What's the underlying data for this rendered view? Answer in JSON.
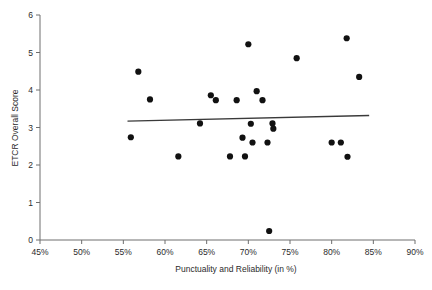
{
  "chart_data": {
    "type": "scatter",
    "title": "",
    "xlabel": "Punctuality and Reliability (in %)",
    "ylabel": "ETCR Overall Score",
    "xlim": [
      45,
      90
    ],
    "ylim": [
      0,
      6
    ],
    "xticks": [
      45,
      50,
      55,
      60,
      65,
      70,
      75,
      80,
      85,
      90
    ],
    "xtick_labels": [
      "45%",
      "50%",
      "55%",
      "60%",
      "65%",
      "70%",
      "75%",
      "80%",
      "85%",
      "90%"
    ],
    "yticks": [
      0,
      1,
      2,
      3,
      4,
      5,
      6
    ],
    "ytick_labels": [
      "0",
      "1",
      "2",
      "3",
      "4",
      "5",
      "6"
    ],
    "grid": false,
    "legend": false,
    "marker_color": "#111111",
    "trendline_color": "#3a3a3a",
    "axis_color": "#6e6e6e",
    "points": [
      {
        "x": 55.9,
        "y": 2.74
      },
      {
        "x": 56.8,
        "y": 4.49
      },
      {
        "x": 58.2,
        "y": 3.75
      },
      {
        "x": 61.6,
        "y": 2.23
      },
      {
        "x": 64.2,
        "y": 3.11
      },
      {
        "x": 65.5,
        "y": 3.86
      },
      {
        "x": 66.1,
        "y": 3.73
      },
      {
        "x": 67.8,
        "y": 2.23
      },
      {
        "x": 68.6,
        "y": 3.73
      },
      {
        "x": 69.3,
        "y": 2.73
      },
      {
        "x": 69.6,
        "y": 2.23
      },
      {
        "x": 70.0,
        "y": 5.22
      },
      {
        "x": 70.3,
        "y": 3.1
      },
      {
        "x": 70.5,
        "y": 2.6
      },
      {
        "x": 71.0,
        "y": 3.97
      },
      {
        "x": 71.7,
        "y": 3.73
      },
      {
        "x": 72.3,
        "y": 2.6
      },
      {
        "x": 72.5,
        "y": 0.24
      },
      {
        "x": 72.9,
        "y": 3.11
      },
      {
        "x": 73.0,
        "y": 2.97
      },
      {
        "x": 75.8,
        "y": 4.85
      },
      {
        "x": 80.0,
        "y": 2.6
      },
      {
        "x": 81.1,
        "y": 2.6
      },
      {
        "x": 81.8,
        "y": 5.38
      },
      {
        "x": 81.9,
        "y": 2.22
      },
      {
        "x": 83.3,
        "y": 4.35
      }
    ],
    "trendline": {
      "x1": 55.5,
      "y1": 3.17,
      "x2": 84.5,
      "y2": 3.32
    }
  }
}
